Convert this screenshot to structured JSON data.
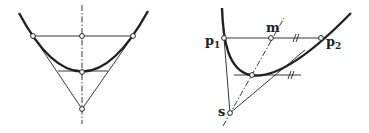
{
  "colors": {
    "ink": "#222222",
    "background": "#ffffff"
  },
  "figures": [
    {
      "id": "symmetric-parabola",
      "description": "Parabola with vertical axis, chord through two points, tangent lines meeting at apex on axis, horizontal tangent at vertex",
      "labels": []
    },
    {
      "id": "general-parabola",
      "description": "Parabola with chord p1-p2, midpoint m, tangents from p1 and p2 meeting at s; line s-m passes through tangent point; tangent at that point parallel to chord",
      "labels": {
        "p1": "p",
        "p1_sub": "1",
        "p2": "p",
        "p2_sub": "2",
        "m": "m",
        "s": "s"
      },
      "parallel_marks": [
        "#",
        "#"
      ]
    }
  ]
}
